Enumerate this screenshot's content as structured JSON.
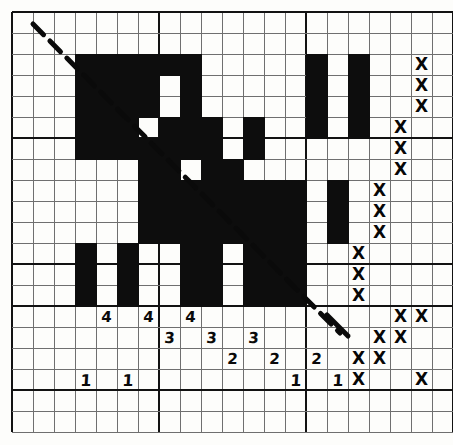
{
  "figure": {
    "grid": {
      "origin_x": 12,
      "origin_y": 12,
      "cell": 21,
      "cols": 21,
      "rows": 20,
      "major_every_x": 7,
      "major_every_y": 6,
      "grid_color": "#6f6f6f",
      "major_color": "#121212",
      "axis_col": 14,
      "axis_row": 14
    },
    "colors": {
      "fill": "#0d0d0d",
      "paper": "#fdfdfb",
      "ink": "#0a0a0a"
    }
  },
  "chart_data": {
    "type": "heatmap",
    "xlabel": "",
    "ylabel": "",
    "grid_cols": 21,
    "grid_rows": 20,
    "filled_cells": [
      {
        "col": 3,
        "row": 2,
        "w": 1,
        "h": 5
      },
      {
        "col": 4,
        "row": 2,
        "w": 1,
        "h": 5
      },
      {
        "col": 5,
        "row": 2,
        "w": 1,
        "h": 3
      },
      {
        "col": 6,
        "row": 2,
        "w": 1,
        "h": 3
      },
      {
        "col": 7,
        "row": 2,
        "w": 1,
        "h": 1
      },
      {
        "col": 8,
        "row": 2,
        "w": 1,
        "h": 3
      },
      {
        "col": 5,
        "row": 5,
        "w": 1,
        "h": 2
      },
      {
        "col": 6,
        "row": 6,
        "w": 1,
        "h": 1
      },
      {
        "col": 7,
        "row": 5,
        "w": 1,
        "h": 2
      },
      {
        "col": 8,
        "row": 5,
        "w": 1,
        "h": 2
      },
      {
        "col": 9,
        "row": 5,
        "w": 1,
        "h": 2
      },
      {
        "col": 11,
        "row": 5,
        "w": 1,
        "h": 2
      },
      {
        "col": 14,
        "row": 2,
        "w": 1,
        "h": 4
      },
      {
        "col": 16,
        "row": 2,
        "w": 1,
        "h": 4
      },
      {
        "col": 6,
        "row": 7,
        "w": 1,
        "h": 4
      },
      {
        "col": 7,
        "row": 7,
        "w": 1,
        "h": 4
      },
      {
        "col": 8,
        "row": 8,
        "w": 1,
        "h": 3
      },
      {
        "col": 9,
        "row": 7,
        "w": 1,
        "h": 4
      },
      {
        "col": 10,
        "row": 7,
        "w": 1,
        "h": 4
      },
      {
        "col": 11,
        "row": 8,
        "w": 1,
        "h": 3
      },
      {
        "col": 12,
        "row": 8,
        "w": 1,
        "h": 3
      },
      {
        "col": 13,
        "row": 8,
        "w": 1,
        "h": 3
      },
      {
        "col": 15,
        "row": 8,
        "w": 1,
        "h": 3
      },
      {
        "col": 3,
        "row": 11,
        "w": 1,
        "h": 3
      },
      {
        "col": 5,
        "row": 11,
        "w": 1,
        "h": 3
      },
      {
        "col": 8,
        "row": 11,
        "w": 1,
        "h": 3
      },
      {
        "col": 9,
        "row": 11,
        "w": 1,
        "h": 3
      },
      {
        "col": 11,
        "row": 11,
        "w": 1,
        "h": 3
      },
      {
        "col": 12,
        "row": 11,
        "w": 1,
        "h": 3
      },
      {
        "col": 13,
        "row": 11,
        "w": 1,
        "h": 3
      }
    ],
    "diagonal": {
      "style": "dashed",
      "from": {
        "x": 33,
        "y": 24
      },
      "to": {
        "x": 340,
        "y": 333
      },
      "color": "#0a0a0a",
      "width": 5
    },
    "axis_labels": [
      {
        "text": "4",
        "col": 4,
        "row": 14
      },
      {
        "text": "4",
        "col": 6,
        "row": 14
      },
      {
        "text": "4",
        "col": 8,
        "row": 14
      },
      {
        "text": "3",
        "col": 7,
        "row": 15
      },
      {
        "text": "3",
        "col": 9,
        "row": 15
      },
      {
        "text": "3",
        "col": 11,
        "row": 15
      },
      {
        "text": "2",
        "col": 10,
        "row": 16
      },
      {
        "text": "2",
        "col": 12,
        "row": 16
      },
      {
        "text": "2",
        "col": 14,
        "row": 16
      },
      {
        "text": "1",
        "col": 3,
        "row": 17
      },
      {
        "text": "1",
        "col": 5,
        "row": 17
      },
      {
        "text": "1",
        "col": 13,
        "row": 17
      },
      {
        "text": "1",
        "col": 15,
        "row": 17
      }
    ],
    "x_marks": [
      {
        "col": 19,
        "row": 2
      },
      {
        "col": 19,
        "row": 3
      },
      {
        "col": 19,
        "row": 4
      },
      {
        "col": 18,
        "row": 5
      },
      {
        "col": 18,
        "row": 6
      },
      {
        "col": 18,
        "row": 7
      },
      {
        "col": 17,
        "row": 8
      },
      {
        "col": 17,
        "row": 9
      },
      {
        "col": 17,
        "row": 10
      },
      {
        "col": 16,
        "row": 11
      },
      {
        "col": 16,
        "row": 12
      },
      {
        "col": 16,
        "row": 13
      },
      {
        "col": 18,
        "row": 14
      },
      {
        "col": 19,
        "row": 14
      },
      {
        "col": 17,
        "row": 15
      },
      {
        "col": 18,
        "row": 15
      },
      {
        "col": 16,
        "row": 16
      },
      {
        "col": 17,
        "row": 16
      },
      {
        "col": 16,
        "row": 17
      },
      {
        "col": 19,
        "row": 17
      }
    ],
    "lower_diagonal": {
      "style": "solid",
      "from": {
        "x": 327,
        "y": 315
      },
      "to": {
        "x": 348,
        "y": 336
      },
      "color": "#0a0a0a",
      "width": 5
    }
  }
}
